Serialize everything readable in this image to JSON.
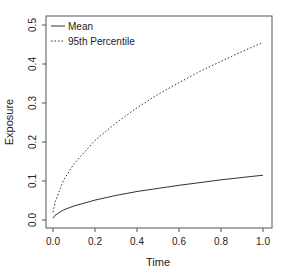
{
  "chart_data": {
    "type": "line",
    "title": "",
    "xlabel": "Time",
    "ylabel": "Exposure",
    "xlim": [
      0,
      1
    ],
    "ylim": [
      0,
      0.5
    ],
    "xticks": [
      "0.0",
      "0.2",
      "0.4",
      "0.6",
      "0.8",
      "1.0"
    ],
    "yticks": [
      "0.0",
      "0.1",
      "0.2",
      "0.3",
      "0.4",
      "0.5"
    ],
    "grid": false,
    "legend_position": "top-left",
    "x": [
      0.0,
      0.01,
      0.05,
      0.1,
      0.2,
      0.3,
      0.4,
      0.5,
      0.6,
      0.7,
      0.8,
      0.9,
      1.0
    ],
    "series": [
      {
        "name": "Mean",
        "style": "solid",
        "values": [
          0.005,
          0.012,
          0.026,
          0.036,
          0.051,
          0.063,
          0.073,
          0.081,
          0.089,
          0.096,
          0.103,
          0.109,
          0.115
        ]
      },
      {
        "name": "95th Percentile",
        "style": "dotted",
        "values": [
          0.02,
          0.046,
          0.102,
          0.144,
          0.204,
          0.249,
          0.288,
          0.322,
          0.352,
          0.381,
          0.407,
          0.432,
          0.455
        ]
      }
    ]
  },
  "legend": {
    "items": [
      "Mean",
      "95th Percentile"
    ]
  },
  "colors": {
    "line": "#333333",
    "axis": "#555555"
  }
}
